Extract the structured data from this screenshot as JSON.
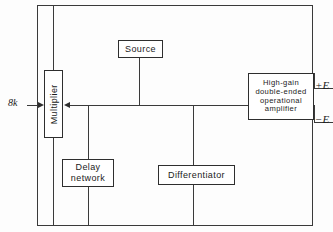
{
  "diagram": {
    "line_color": "#3a3a3a",
    "box_border_color": "#2e2e2e",
    "background_color": "#fdfdfd",
    "text_color": "#1b1b1b"
  },
  "blocks": {
    "source": {
      "label": "Source"
    },
    "multiplier": {
      "label": "Multiplier",
      "orientation": "vertical"
    },
    "amplifier": {
      "label": "High-gain\ndouble-ended\noperational\namplifier"
    },
    "delay": {
      "label": "Delay\nnetwork"
    },
    "differentiator": {
      "label": "Differentiator"
    }
  },
  "labels": {
    "input_signal": "8k",
    "output_positive": "+E",
    "output_negative": "−E"
  },
  "icons": {
    "input_arrow": "arrow-right-icon",
    "bus_arrow": "arrow-left-icon"
  }
}
